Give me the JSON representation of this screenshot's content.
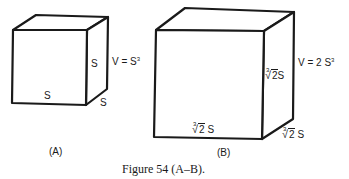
{
  "figure": {
    "caption": "Figure 54 (A–B).",
    "panels": [
      {
        "id": "A",
        "label": "(A)",
        "volume_label": "V = S",
        "volume_exponent": "3",
        "edge_labels": {
          "bottom": "S",
          "right_vertical": "S",
          "depth": "S"
        }
      },
      {
        "id": "B",
        "label": "(B)",
        "volume_label": "V = 2 S",
        "volume_exponent": "3",
        "edge_labels": {
          "bottom_root_index": "3",
          "bottom_radicand": "2",
          "bottom_suffix": " S",
          "right_vertical_root_index": "3",
          "right_vertical_radicand": "2",
          "right_vertical_suffix": "S",
          "depth_root_index": "3",
          "depth_radicand": "2",
          "depth_suffix": " S"
        }
      }
    ],
    "colors": {
      "line": "#1a1a1a",
      "background": "#ffffff"
    }
  }
}
